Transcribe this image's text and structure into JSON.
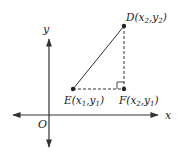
{
  "diagram": {
    "type": "coordinate-geometry",
    "axes": {
      "x_label": "x",
      "y_label": "y",
      "origin_label": "O"
    },
    "points": [
      {
        "id": "D",
        "label": "D(x",
        "sub1": "2",
        "mid": ",y",
        "sub2": "2",
        "end": ")",
        "x": 124,
        "y": 26
      },
      {
        "id": "E",
        "label": "E(x",
        "sub1": "1",
        "mid": ",y",
        "sub2": "1",
        "end": ")",
        "x": 73,
        "y": 89
      },
      {
        "id": "F",
        "label": "F(x",
        "sub1": "2",
        "mid": ",y",
        "sub2": "1",
        "end": ")",
        "x": 124,
        "y": 89
      }
    ],
    "segments": [
      {
        "from": "E",
        "to": "D",
        "style": "solid"
      },
      {
        "from": "E",
        "to": "F",
        "style": "dashed"
      },
      {
        "from": "F",
        "to": "D",
        "style": "dashed"
      }
    ],
    "right_angle_at": "F",
    "colors": {
      "stroke": "#333333",
      "text": "#222222",
      "background": "#ffffff"
    }
  }
}
